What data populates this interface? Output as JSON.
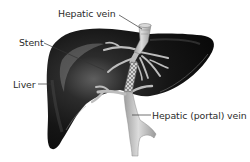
{
  "diagram": {
    "labels": {
      "hepatic_vein": "Hepatic vein",
      "stent": "Stent",
      "liver": "Liver",
      "portal_vein": "Hepatic (portal) vein"
    },
    "colors": {
      "background": "#ffffff",
      "liver": "#141414",
      "liver_highlight": "#6a6a6a",
      "vessel": "#b8b8b8",
      "vessel_highlight": "#e2e2e2",
      "stent": "#9a9a9a",
      "leader_line": "#333333",
      "text": "#2b2b2b"
    }
  }
}
